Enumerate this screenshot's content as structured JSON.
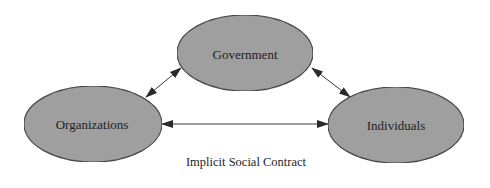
{
  "diagram": {
    "type": "relationship-diagram",
    "nodes": [
      {
        "id": "government",
        "label": "Government",
        "cx": 245,
        "cy": 53,
        "rx": 68,
        "ry": 38
      },
      {
        "id": "organizations",
        "label": "Organizations",
        "cx": 93,
        "cy": 124,
        "rx": 69,
        "ry": 38
      },
      {
        "id": "individuals",
        "label": "Individuals",
        "cx": 396,
        "cy": 125,
        "rx": 68,
        "ry": 38
      }
    ],
    "edges": [
      {
        "from": "organizations",
        "to": "government",
        "direction": "bidirectional"
      },
      {
        "from": "government",
        "to": "individuals",
        "direction": "bidirectional"
      },
      {
        "from": "organizations",
        "to": "individuals",
        "direction": "bidirectional"
      }
    ],
    "caption": "Implicit Social Contract",
    "colors": {
      "node_fill": "#a3a3a3",
      "node_stroke": "#4a4a4a",
      "arrow": "#2a2a2a",
      "text": "#1e1e1e",
      "background": "#ffffff"
    }
  }
}
